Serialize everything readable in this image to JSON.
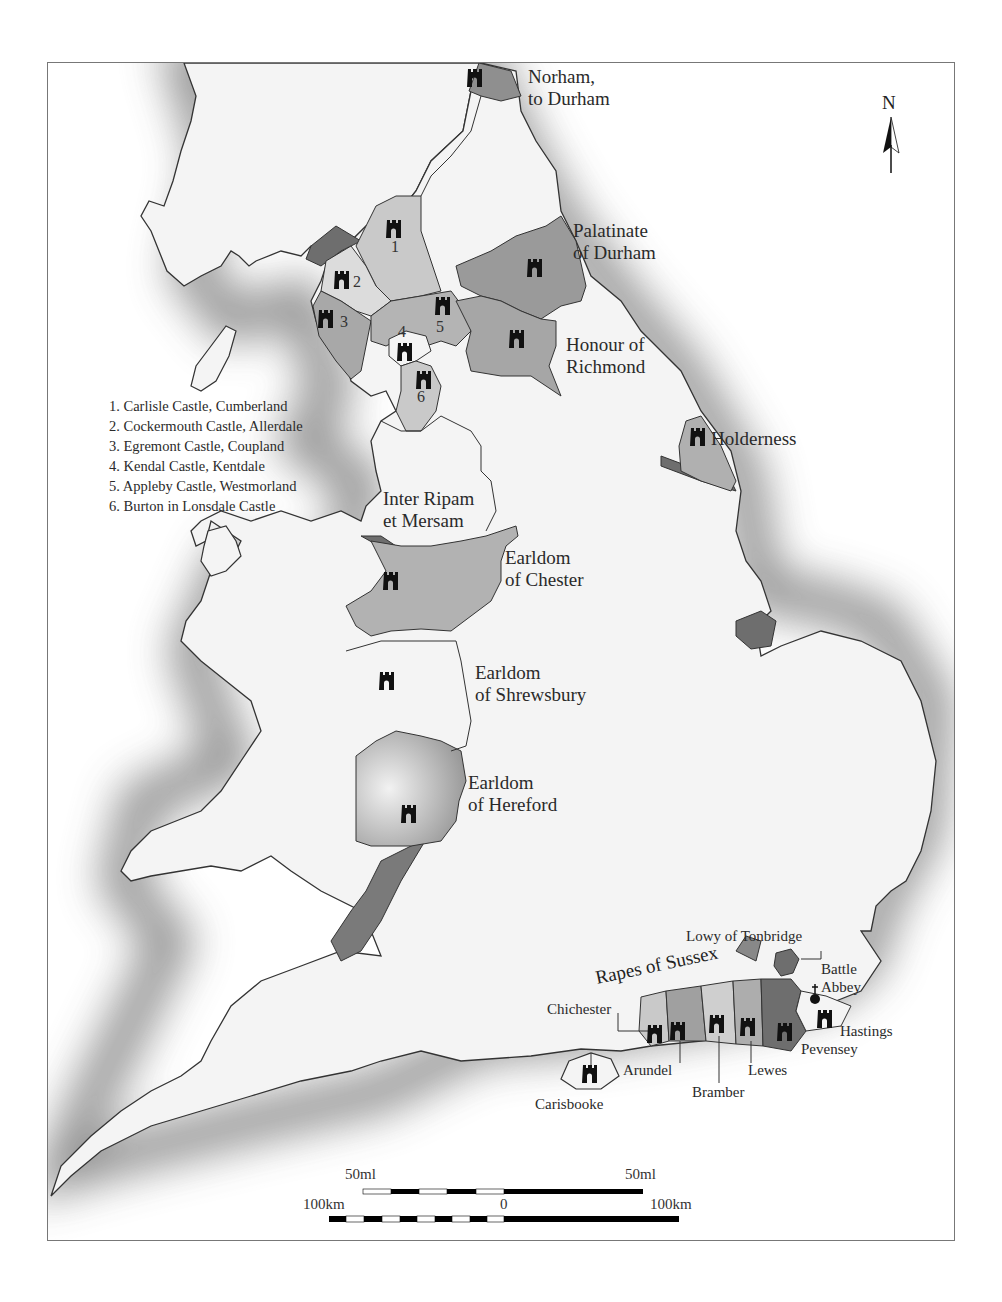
{
  "map": {
    "title": "",
    "north_label": "N",
    "legend": {
      "items": [
        "1. Carlisle Castle, Cumberland",
        "2. Cockermouth Castle, Allerdale",
        "3. Egremont Castle, Coupland",
        "4. Kendal Castle, Kentdale",
        "5. Appleby Castle, Westmorland",
        "6. Burton in Lonsdale Castle"
      ]
    },
    "region_numbers": [
      "1",
      "2",
      "3",
      "4",
      "5",
      "6"
    ],
    "labels": {
      "norham_1": "Norham,",
      "norham_2": "to Durham",
      "durham_1": "Palatinate",
      "durham_2": "of Durham",
      "richmond_1": "Honour of",
      "richmond_2": "Richmond",
      "holderness": "Holderness",
      "ripam_1": "Inter Ripam",
      "ripam_2": "et Mersam",
      "chester_1": "Earldom",
      "chester_2": "of Chester",
      "shrewsbury_1": "Earldom",
      "shrewsbury_2": "of Shrewsbury",
      "hereford_1": "Earldom",
      "hereford_2": "of Hereford",
      "tonbridge": "Lowy of Tonbridge",
      "rapes": "Rapes of Sussex",
      "battle_1": "Battle",
      "battle_2": "Abbey",
      "chichester": "Chichester",
      "arundel": "Arundel",
      "bramber": "Bramber",
      "lewes": "Lewes",
      "pevensey": "Pevensey",
      "hastings": "Hastings",
      "carisbrooke": "Carisbooke"
    },
    "scale": {
      "miles_left": "50ml",
      "miles_right": "50ml",
      "km_left": "100km",
      "km_zero": "0",
      "km_right": "100km"
    },
    "colors": {
      "land": "#f4f4f4",
      "sea_shadow": "#7a7a7a",
      "region_light": "#c9c9c9",
      "region_mid": "#a3a3a3",
      "region_dark": "#6e6e6e",
      "castle": "#111111",
      "border": "#777777"
    }
  }
}
